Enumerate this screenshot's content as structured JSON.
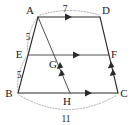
{
  "figure": {
    "kind": "geometry-diagram",
    "shape": "trapezoid",
    "stroke_color": "#2b2b2b",
    "guide_color": "#9a9a9a",
    "background": "#ffffff",
    "vertices": [
      {
        "id": "A",
        "label": "A",
        "x": 38,
        "y": 17,
        "label_x": 30,
        "label_y": 14
      },
      {
        "id": "D",
        "label": "D",
        "x": 100,
        "y": 17,
        "label_x": 104,
        "label_y": 14
      },
      {
        "id": "E",
        "label": "E",
        "x": 28,
        "y": 55,
        "label_x": 18,
        "label_y": 54
      },
      {
        "id": "F",
        "label": "F",
        "x": 109,
        "y": 55,
        "label_x": 112,
        "label_y": 54
      },
      {
        "id": "G",
        "label": "G",
        "x": 57,
        "y": 55,
        "label_x": 51,
        "label_y": 67
      },
      {
        "id": "B",
        "label": "B",
        "x": 18,
        "y": 93,
        "label_x": 8,
        "label_y": 97
      },
      {
        "id": "H",
        "label": "H",
        "x": 70,
        "y": 93,
        "label_x": 64,
        "label_y": 105
      },
      {
        "id": "C",
        "label": "C",
        "x": 118,
        "y": 93,
        "label_x": 121,
        "label_y": 97
      }
    ],
    "segments": [
      {
        "id": "AD",
        "from": "A",
        "to": "D",
        "style": "solid",
        "ticks": 1,
        "note": "top base, parallel mark"
      },
      {
        "id": "AB",
        "from": "A",
        "to": "B",
        "style": "solid",
        "ticks": 0,
        "note": "left leg through E"
      },
      {
        "id": "DC",
        "from": "D",
        "to": "C",
        "style": "solid",
        "ticks": 0,
        "note": "right leg through F"
      },
      {
        "id": "BC",
        "from": "B",
        "to": "C",
        "style": "solid",
        "ticks": 1,
        "note": "bottom base, parallel mark"
      },
      {
        "id": "EF",
        "from": "E",
        "to": "F",
        "style": "thin",
        "ticks": 1,
        "note": "midsegment, parallel mark"
      },
      {
        "id": "AH",
        "from": "A",
        "to": "H",
        "style": "thin",
        "ticks": 0,
        "note": "cevian from A to H, meets EF at G"
      },
      {
        "id": "GH",
        "from": "G",
        "to": "H",
        "style": "thin",
        "ticks": 2,
        "note": "double chevron congruence mark"
      },
      {
        "id": "FC",
        "from": "F",
        "to": "C",
        "style": "solid",
        "ticks": 2,
        "note": "double chevron congruence mark"
      }
    ],
    "measures": [
      {
        "id": "len-AD",
        "value": "7",
        "x": 65,
        "y": 11,
        "for": "AD",
        "along": "top-arc"
      },
      {
        "id": "len-AE",
        "value": "5",
        "x": 28,
        "y": 37,
        "for": "AE",
        "along": "left-upper-arc"
      },
      {
        "id": "len-EB",
        "value": "5",
        "x": 19,
        "y": 75,
        "for": "EB",
        "along": "left-lower-arc"
      },
      {
        "id": "len-BC",
        "value": "11",
        "x": 65,
        "y": 119,
        "for": "BC",
        "along": "bottom-arc"
      }
    ],
    "guide_arcs": [
      {
        "id": "arc-top",
        "d": "M 40 15 Q 69 6 99 15",
        "for": "AD"
      },
      {
        "id": "arc-left-upper",
        "d": "M 36 19 Q 26 36 28 53",
        "for": "AE"
      },
      {
        "id": "arc-left-lower",
        "d": "M 26 57 Q 16 75 18 91",
        "for": "EB"
      },
      {
        "id": "arc-bottom",
        "d": "M 19 95 Q 68 124 117 95",
        "for": "BC"
      }
    ]
  }
}
